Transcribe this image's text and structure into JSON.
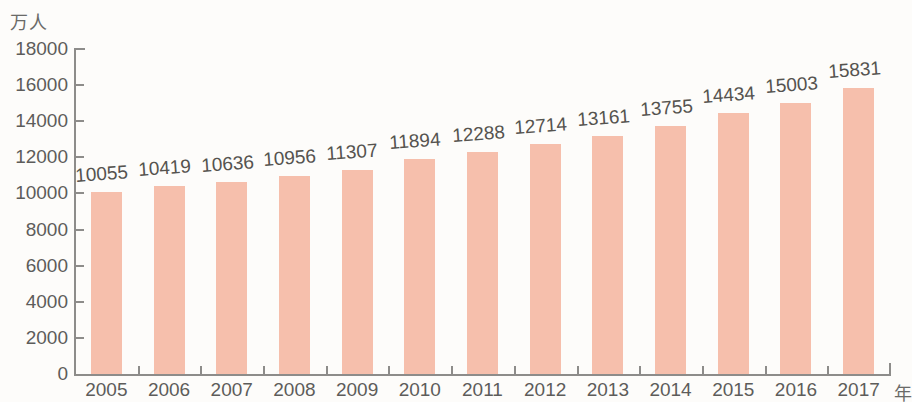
{
  "chart_data": {
    "type": "bar",
    "title": "",
    "subtitle": "",
    "xlabel": "年",
    "ylabel": "万人",
    "categories": [
      "2005",
      "2006",
      "2007",
      "2008",
      "2009",
      "2010",
      "2011",
      "2012",
      "2013",
      "2014",
      "2015",
      "2016",
      "2017"
    ],
    "values": [
      10055,
      10419,
      10636,
      10956,
      11307,
      11894,
      12288,
      12714,
      13161,
      13755,
      14434,
      15003,
      15831
    ],
    "data_labels": [
      "10055",
      "10419",
      "10636",
      "10956",
      "11307",
      "11894",
      "12288",
      "12714",
      "13161",
      "13755",
      "14434",
      "15003",
      "15831"
    ],
    "ylim": [
      0,
      18000
    ],
    "ytick_values": [
      0,
      2000,
      4000,
      6000,
      8000,
      10000,
      12000,
      14000,
      16000,
      18000
    ],
    "ytick_labels": [
      "0",
      "2000",
      "4000",
      "6000",
      "8000",
      "10000",
      "12000",
      "14000",
      "16000",
      "18000"
    ],
    "grid": false,
    "legend": null,
    "legend_position": "none",
    "bar_color": "#f6bfac",
    "axis_color": "#8d8c8a",
    "text_color": "#5d5c5a",
    "background_color": "#fdfcfa"
  }
}
